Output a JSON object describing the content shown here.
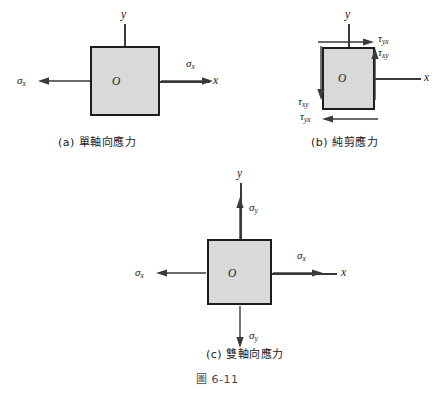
{
  "figure": {
    "number_label": "圖 6-11",
    "background_color": "#ffffff",
    "element_fill_color": "#d9d9d9",
    "element_border_color": "#1c1c1c",
    "arrow_color": "#3a3a3a"
  },
  "panels": [
    {
      "id": "a",
      "caption": "(a) 單軸向應力",
      "origin_label": "O",
      "axes": [
        {
          "name": "y-axis",
          "label": "y"
        },
        {
          "name": "x-axis",
          "label": "x"
        }
      ],
      "stresses": [
        {
          "name": "sigma-x-left",
          "symbol": "σ",
          "subscript": "x",
          "direction": "left"
        },
        {
          "name": "sigma-x-right",
          "symbol": "σ",
          "subscript": "x",
          "direction": "right"
        }
      ]
    },
    {
      "id": "b",
      "caption": "(b) 純剪應力",
      "origin_label": "O",
      "axes": [
        {
          "name": "y-axis",
          "label": "y"
        },
        {
          "name": "x-axis",
          "label": "x"
        }
      ],
      "stresses": [
        {
          "name": "tau-yx-top",
          "symbol": "τ",
          "subscript": "yx",
          "direction": "right"
        },
        {
          "name": "tau-xy-right",
          "symbol": "τ",
          "subscript": "xy",
          "direction": "up"
        },
        {
          "name": "tau-xy-left",
          "symbol": "τ",
          "subscript": "xy",
          "direction": "down"
        },
        {
          "name": "tau-yx-bottom",
          "symbol": "τ",
          "subscript": "yx",
          "direction": "left"
        }
      ]
    },
    {
      "id": "c",
      "caption": "(c) 雙軸向應力",
      "origin_label": "O",
      "axes": [
        {
          "name": "y-axis",
          "label": "y"
        },
        {
          "name": "x-axis",
          "label": "x"
        }
      ],
      "stresses": [
        {
          "name": "sigma-y-top",
          "symbol": "σ",
          "subscript": "y",
          "direction": "up"
        },
        {
          "name": "sigma-y-bottom",
          "symbol": "σ",
          "subscript": "y",
          "direction": "down"
        },
        {
          "name": "sigma-x-left",
          "symbol": "σ",
          "subscript": "x",
          "direction": "left"
        },
        {
          "name": "sigma-x-right",
          "symbol": "σ",
          "subscript": "x",
          "direction": "right"
        }
      ]
    }
  ]
}
